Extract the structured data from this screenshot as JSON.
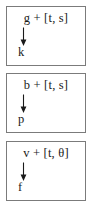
{
  "diagram": {
    "type": "rule-boxes",
    "background_color": "#ffffff",
    "border_color": "#7b7b7b",
    "text_color": "#1a1a1a",
    "arrow_glyph": "down-arrow",
    "boxes": [
      {
        "id": "box-1",
        "premise": "g + [t, s]",
        "arrow": "↓",
        "conclusion": "k"
      },
      {
        "id": "box-2",
        "premise": "b + [t, s]",
        "arrow": "↓",
        "conclusion": "p"
      },
      {
        "id": "box-3",
        "premise": "v + [t, θ]",
        "arrow": "↓",
        "conclusion": "f"
      }
    ]
  }
}
